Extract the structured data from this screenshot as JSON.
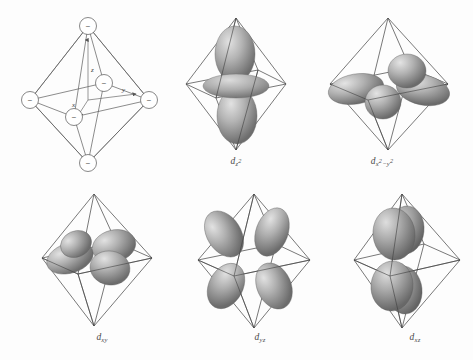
{
  "figure": {
    "title_present": false,
    "background_color": "#fdfdfd",
    "edge_color": "#4c4c4c",
    "lobe_light": "#dcdcdc",
    "lobe_mid": "#a8a8a8",
    "lobe_dark": "#6a6a6a",
    "charge_symbol": "−"
  },
  "panels": [
    {
      "id": "ligand-field",
      "caption": "",
      "caption_plain": "",
      "has_orbital": false,
      "charges": [
        {
          "label": "−",
          "position": "top"
        },
        {
          "label": "−",
          "position": "bottom"
        },
        {
          "label": "−",
          "position": "left"
        },
        {
          "label": "−",
          "position": "right"
        },
        {
          "label": "−",
          "position": "front"
        },
        {
          "label": "−",
          "position": "back"
        }
      ],
      "axes": [
        {
          "label": "z",
          "direction": "up"
        },
        {
          "label": "y",
          "direction": "right"
        },
        {
          "label": "x",
          "direction": "front-left"
        }
      ]
    },
    {
      "id": "dz2",
      "caption_plain": "dz2",
      "caption_base": "d",
      "caption_sub": "z",
      "caption_sup": "2",
      "has_orbital": true,
      "orbital_type": "dz2"
    },
    {
      "id": "dx2-y2",
      "caption_plain": "dx2−y2",
      "caption_base": "d",
      "caption_sub_a": "x",
      "caption_sup_a": "2",
      "caption_minus": "−",
      "caption_sub_b": "y",
      "caption_sup_b": "2",
      "has_orbital": true,
      "orbital_type": "dx2-y2"
    },
    {
      "id": "dxy",
      "caption_plain": "dxy",
      "caption_base": "d",
      "caption_sub": "xy",
      "has_orbital": true,
      "orbital_type": "dxy"
    },
    {
      "id": "dyz",
      "caption_plain": "dyz",
      "caption_base": "d",
      "caption_sub": "yz",
      "has_orbital": true,
      "orbital_type": "dyz"
    },
    {
      "id": "dxz",
      "caption_plain": "dxz",
      "caption_base": "d",
      "caption_sub": "xz",
      "has_orbital": true,
      "orbital_type": "dxz"
    }
  ],
  "captions": {
    "dz2": {
      "base": "d",
      "sub": "z",
      "sup": "2"
    },
    "dx2y2": {
      "base": "d",
      "sub1": "x",
      "sup1": "2",
      "minus": "−",
      "sub2": "y",
      "sup2": "2"
    },
    "dxy": {
      "base": "d",
      "sub": "xy"
    },
    "dyz": {
      "base": "d",
      "sub": "yz"
    },
    "dxz": {
      "base": "d",
      "sub": "xz"
    }
  },
  "axis_labels": {
    "z": "z",
    "y": "y",
    "x": "x"
  },
  "charge": {
    "symbol": "−"
  }
}
